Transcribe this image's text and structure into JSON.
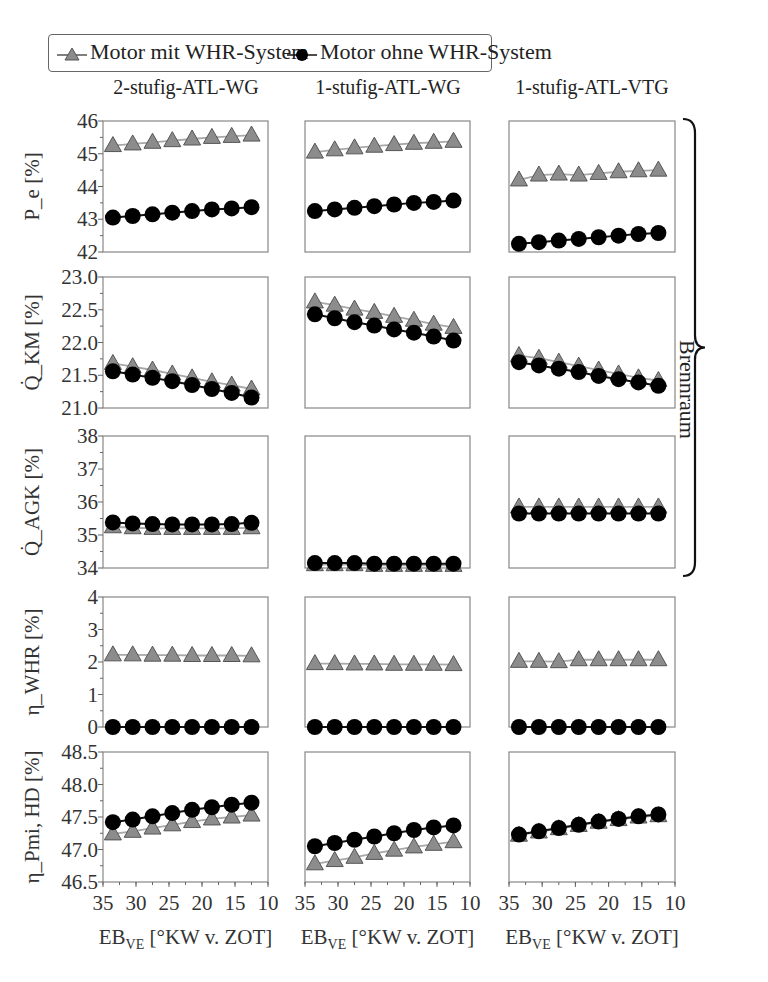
{
  "legend": {
    "series_with": "Motor mit WHR-System",
    "series_without": "Motor ohne WHR-System"
  },
  "columns": [
    "2-stufig-ATL-WG",
    "1-stufig-ATL-WG",
    "1-stufig-ATL-VTG"
  ],
  "brace_label": "Brennraum",
  "x_axis": {
    "label": "EB_VE [°KW v. ZOT]",
    "ticks": [
      "35",
      "30",
      "25",
      "20",
      "15",
      "10"
    ]
  },
  "colors": {
    "with_marker": "#8c8c8c",
    "with_line": "#a8a8a8",
    "without_marker": "#000000",
    "frame": "#888888"
  },
  "chart_data": {
    "type": "line",
    "layout": "5 rows x 3 columns small multiples",
    "x": [
      33.5,
      30.5,
      27.5,
      24.5,
      21.5,
      18.5,
      15.5,
      12.5
    ],
    "xlabel": "EB_VE [°KW v. ZOT]",
    "xlim": [
      35,
      10
    ],
    "xticks": [
      35,
      30,
      25,
      20,
      15,
      10
    ],
    "legend": [
      "Motor mit WHR-System",
      "Motor ohne WHR-System"
    ],
    "legend_position": "top",
    "grid": false,
    "columns": [
      "2-stufig-ATL-WG",
      "1-stufig-ATL-WG",
      "1-stufig-ATL-VTG"
    ],
    "rows": [
      {
        "ylabel": "P_e [%]",
        "ylim": [
          42,
          46
        ],
        "yticks": [
          "42",
          "43",
          "44",
          "45",
          "46"
        ],
        "panels": [
          {
            "series": [
              {
                "name": "Motor mit WHR-System",
                "values": [
                  45.25,
                  45.3,
                  45.35,
                  45.4,
                  45.45,
                  45.5,
                  45.53,
                  45.57
                ]
              },
              {
                "name": "Motor ohne WHR-System",
                "values": [
                  43.05,
                  43.1,
                  43.15,
                  43.2,
                  43.25,
                  43.3,
                  43.33,
                  43.37
                ]
              }
            ]
          },
          {
            "series": [
              {
                "name": "Motor mit WHR-System",
                "values": [
                  45.05,
                  45.12,
                  45.18,
                  45.23,
                  45.28,
                  45.32,
                  45.35,
                  45.38
                ]
              },
              {
                "name": "Motor ohne WHR-System",
                "values": [
                  43.25,
                  43.3,
                  43.35,
                  43.4,
                  43.45,
                  43.5,
                  43.53,
                  43.57
                ]
              }
            ]
          },
          {
            "series": [
              {
                "name": "Motor mit WHR-System",
                "values": [
                  44.2,
                  44.35,
                  44.38,
                  44.35,
                  44.4,
                  44.45,
                  44.48,
                  44.5
                ]
              },
              {
                "name": "Motor ohne WHR-System",
                "values": [
                  42.25,
                  42.3,
                  42.35,
                  42.4,
                  42.45,
                  42.5,
                  42.55,
                  42.58
                ]
              }
            ]
          }
        ]
      },
      {
        "ylabel": "Q̇_KM [%]",
        "ylim": [
          21.0,
          23.0
        ],
        "yticks": [
          "21.0",
          "21.5",
          "22.0",
          "22.5",
          "23.0"
        ],
        "panels": [
          {
            "series": [
              {
                "name": "Motor mit WHR-System",
                "values": [
                  21.68,
                  21.63,
                  21.58,
                  21.52,
                  21.46,
                  21.4,
                  21.35,
                  21.29
                ]
              },
              {
                "name": "Motor ohne WHR-System",
                "values": [
                  21.56,
                  21.51,
                  21.46,
                  21.41,
                  21.35,
                  21.29,
                  21.23,
                  21.16
                ]
              }
            ]
          },
          {
            "series": [
              {
                "name": "Motor mit WHR-System",
                "values": [
                  22.62,
                  22.57,
                  22.51,
                  22.46,
                  22.4,
                  22.34,
                  22.28,
                  22.23
                ]
              },
              {
                "name": "Motor ohne WHR-System",
                "values": [
                  22.43,
                  22.37,
                  22.31,
                  22.26,
                  22.2,
                  22.15,
                  22.09,
                  22.03
                ]
              }
            ]
          },
          {
            "series": [
              {
                "name": "Motor mit WHR-System",
                "values": [
                  21.8,
                  21.76,
                  21.7,
                  21.64,
                  21.58,
                  21.52,
                  21.46,
                  21.42
                ]
              },
              {
                "name": "Motor ohne WHR-System",
                "values": [
                  21.7,
                  21.65,
                  21.6,
                  21.55,
                  21.49,
                  21.44,
                  21.39,
                  21.34
                ]
              }
            ]
          }
        ]
      },
      {
        "ylabel": "Q̇_AGK [%]",
        "ylim": [
          34,
          38
        ],
        "yticks": [
          "34",
          "35",
          "36",
          "37",
          "38"
        ],
        "panels": [
          {
            "series": [
              {
                "name": "Motor mit WHR-System",
                "values": [
                  35.25,
                  35.22,
                  35.2,
                  35.2,
                  35.2,
                  35.2,
                  35.2,
                  35.22
                ]
              },
              {
                "name": "Motor ohne WHR-System",
                "values": [
                  35.38,
                  35.35,
                  35.33,
                  35.32,
                  35.32,
                  35.32,
                  35.33,
                  35.37
                ]
              }
            ]
          },
          {
            "series": [
              {
                "name": "Motor mit WHR-System",
                "values": [
                  34.1,
                  34.1,
                  34.1,
                  34.08,
                  34.08,
                  34.08,
                  34.08,
                  34.08
                ]
              },
              {
                "name": "Motor ohne WHR-System",
                "values": [
                  34.15,
                  34.15,
                  34.15,
                  34.13,
                  34.13,
                  34.13,
                  34.13,
                  34.13
                ]
              }
            ]
          },
          {
            "series": [
              {
                "name": "Motor mit WHR-System",
                "values": [
                  35.85,
                  35.85,
                  35.85,
                  35.85,
                  35.85,
                  35.85,
                  35.85,
                  35.85
                ]
              },
              {
                "name": "Motor ohne WHR-System",
                "values": [
                  35.65,
                  35.65,
                  35.65,
                  35.65,
                  35.65,
                  35.65,
                  35.65,
                  35.65
                ]
              }
            ]
          }
        ]
      },
      {
        "ylabel": "η_WHR [%]",
        "ylim": [
          0,
          4
        ],
        "yticks": [
          "0",
          "1",
          "2",
          "3",
          "4"
        ],
        "panels": [
          {
            "series": [
              {
                "name": "Motor mit WHR-System",
                "values": [
                  2.22,
                  2.22,
                  2.21,
                  2.21,
                  2.2,
                  2.2,
                  2.2,
                  2.19
                ]
              },
              {
                "name": "Motor ohne WHR-System",
                "values": [
                  0,
                  0,
                  0,
                  0,
                  0,
                  0,
                  0,
                  0
                ]
              }
            ]
          },
          {
            "series": [
              {
                "name": "Motor mit WHR-System",
                "values": [
                  1.95,
                  1.95,
                  1.94,
                  1.94,
                  1.93,
                  1.93,
                  1.93,
                  1.92
                ]
              },
              {
                "name": "Motor ohne WHR-System",
                "values": [
                  0,
                  0,
                  0,
                  0,
                  0,
                  0,
                  0,
                  0
                ]
              }
            ]
          },
          {
            "series": [
              {
                "name": "Motor mit WHR-System",
                "values": [
                  2.02,
                  2.02,
                  2.01,
                  2.07,
                  2.07,
                  2.07,
                  2.07,
                  2.07
                ]
              },
              {
                "name": "Motor ohne WHR-System",
                "values": [
                  0,
                  0,
                  0,
                  0,
                  0,
                  0,
                  0,
                  0
                ]
              }
            ]
          }
        ]
      },
      {
        "ylabel": "η_Pmi, HD [%]",
        "ylim": [
          46.5,
          48.5
        ],
        "yticks": [
          "46.5",
          "47.0",
          "47.5",
          "48.0",
          "48.5"
        ],
        "panels": [
          {
            "series": [
              {
                "name": "Motor mit WHR-System",
                "values": [
                  47.24,
                  47.28,
                  47.33,
                  47.38,
                  47.43,
                  47.47,
                  47.5,
                  47.53
                ]
              },
              {
                "name": "Motor ohne WHR-System",
                "values": [
                  47.42,
                  47.46,
                  47.51,
                  47.56,
                  47.61,
                  47.65,
                  47.69,
                  47.72
                ]
              }
            ]
          },
          {
            "series": [
              {
                "name": "Motor mit WHR-System",
                "values": [
                  46.78,
                  46.83,
                  46.88,
                  46.94,
                  46.99,
                  47.04,
                  47.08,
                  47.12
                ]
              },
              {
                "name": "Motor ohne WHR-System",
                "values": [
                  47.05,
                  47.1,
                  47.15,
                  47.2,
                  47.25,
                  47.3,
                  47.34,
                  47.37
                ]
              }
            ]
          },
          {
            "series": [
              {
                "name": "Motor mit WHR-System",
                "values": [
                  47.22,
                  47.27,
                  47.32,
                  47.37,
                  47.42,
                  47.46,
                  47.5,
                  47.52
                ]
              },
              {
                "name": "Motor ohne WHR-System",
                "values": [
                  47.23,
                  47.28,
                  47.33,
                  47.38,
                  47.43,
                  47.47,
                  47.51,
                  47.54
                ]
              }
            ]
          }
        ]
      }
    ],
    "annotations": [
      {
        "type": "brace",
        "spans_rows": [
          0,
          1,
          2
        ],
        "text": "Brennraum"
      }
    ]
  }
}
